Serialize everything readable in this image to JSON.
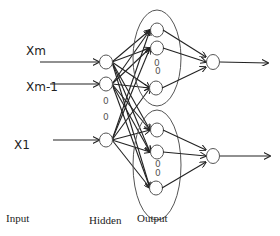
{
  "diagram": {
    "type": "neural-network",
    "inputs": [
      {
        "label": "Xm",
        "y": 62
      },
      {
        "label": "Xm-1",
        "y": 83
      },
      {
        "label": "X1",
        "y": 145
      }
    ],
    "layer_labels": {
      "input": "Input",
      "hidden": "Hidden",
      "output": "Output"
    },
    "ellipsis": "0",
    "colors": {
      "stroke": "#222222",
      "node_stroke": "#555555",
      "background": "#ffffff"
    }
  }
}
